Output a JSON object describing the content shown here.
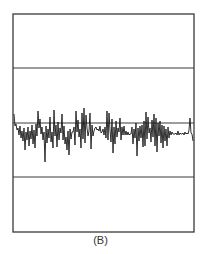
{
  "figure": {
    "label": "(B)"
  },
  "colors": {
    "frame": "#3a3a3a",
    "trace": "#1a1a1a",
    "background": "#ffffff"
  },
  "chart_data": {
    "type": "line",
    "title": "",
    "xlabel": "",
    "ylabel": "",
    "caption": "(B)",
    "grid_lines_y": [
      68,
      123,
      177
    ],
    "frame": {
      "x0": 13,
      "y0": 14,
      "x1": 194,
      "y1": 232
    },
    "baseline_y": 123,
    "x": [
      14,
      15,
      16,
      17,
      18,
      19,
      20,
      21,
      22,
      23,
      24,
      25,
      26,
      27,
      28,
      29,
      30,
      31,
      32,
      33,
      34,
      35,
      36,
      37,
      38,
      39,
      40,
      41,
      42,
      43,
      44,
      45,
      46,
      47,
      48,
      49,
      50,
      51,
      52,
      53,
      54,
      55,
      56,
      57,
      58,
      59,
      60,
      61,
      62,
      63,
      64,
      65,
      66,
      67,
      68,
      69,
      70,
      71,
      72,
      73,
      74,
      75,
      76,
      77,
      78,
      79,
      80,
      81,
      82,
      83,
      84,
      85,
      86,
      87,
      88,
      89,
      90,
      91,
      92,
      93,
      94,
      95,
      96,
      97,
      98,
      99,
      100,
      101,
      102,
      103,
      104,
      105,
      106,
      107,
      108,
      109,
      110,
      111,
      112,
      113,
      114,
      115,
      116,
      117,
      118,
      119,
      120,
      121,
      122,
      123,
      124,
      125,
      126,
      127,
      128,
      129,
      130,
      131,
      132,
      133,
      134,
      135,
      136,
      137,
      138,
      139,
      140,
      141,
      142,
      143,
      144,
      145,
      146,
      147,
      148,
      149,
      150,
      151,
      152,
      153,
      154,
      155,
      156,
      157,
      158,
      159,
      160,
      161,
      162,
      163,
      164,
      165,
      166,
      167,
      168,
      169,
      170,
      171,
      172,
      173,
      174,
      175,
      176,
      177,
      178,
      179,
      180,
      181,
      182,
      183,
      184,
      185,
      186,
      187,
      188,
      189,
      190,
      191,
      192,
      193
    ],
    "values": [
      114,
      126,
      124,
      130,
      128,
      135,
      126,
      138,
      131,
      141,
      128,
      150,
      132,
      140,
      127,
      146,
      131,
      139,
      125,
      144,
      130,
      148,
      124,
      136,
      111,
      128,
      119,
      134,
      127,
      140,
      132,
      162,
      126,
      143,
      129,
      138,
      117,
      142,
      132,
      148,
      110,
      136,
      125,
      147,
      122,
      140,
      128,
      133,
      114,
      140,
      126,
      144,
      137,
      150,
      131,
      155,
      129,
      139,
      132,
      132,
      127,
      145,
      111,
      132,
      120,
      137,
      129,
      148,
      113,
      139,
      108,
      143,
      115,
      128,
      136,
      131,
      113,
      149,
      125,
      136,
      131,
      128,
      127,
      130,
      129,
      131,
      126,
      133,
      132,
      129,
      135,
      127,
      138,
      111,
      140,
      113,
      130,
      142,
      119,
      153,
      127,
      144,
      121,
      137,
      128,
      132,
      118,
      140,
      127,
      135,
      126,
      135,
      131,
      135,
      132,
      135,
      134,
      134,
      127,
      144,
      129,
      138,
      123,
      156,
      128,
      141,
      126,
      138,
      125,
      147,
      121,
      146,
      112,
      139,
      117,
      133,
      128,
      142,
      120,
      137,
      114,
      146,
      118,
      152,
      123,
      136,
      121,
      143,
      125,
      148,
      126,
      141,
      129,
      146,
      127,
      138,
      131,
      135,
      132,
      134,
      134,
      134,
      133,
      135,
      131,
      135,
      133,
      134,
      134,
      133,
      135,
      132,
      134,
      133,
      134,
      130,
      118,
      133,
      134,
      141
    ]
  }
}
